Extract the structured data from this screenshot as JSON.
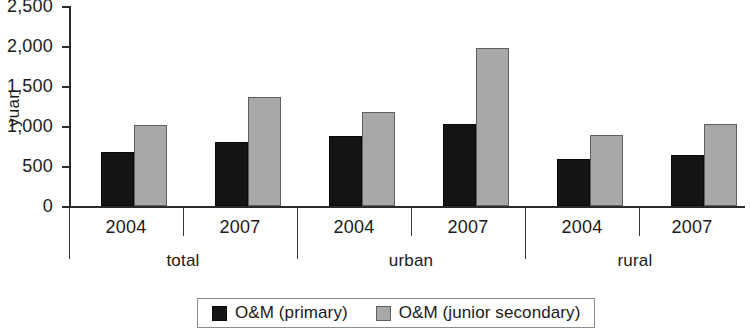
{
  "chart_data": {
    "type": "bar",
    "title": "",
    "subtitle": "",
    "xlabel": "",
    "ylabel": "yuan",
    "ylim": [
      0,
      2500
    ],
    "yticks": [
      "0",
      "500",
      "1,000",
      "1,500",
      "2,000",
      "2,500"
    ],
    "ytick_values": [
      0,
      500,
      1000,
      1500,
      2000,
      2500
    ],
    "grid": false,
    "legend_position": "bottom",
    "categories": [
      "2004",
      "2007",
      "2004",
      "2007",
      "2004",
      "2007"
    ],
    "groups": [
      {
        "label": "total",
        "years": [
          "2004",
          "2007"
        ]
      },
      {
        "label": "urban",
        "years": [
          "2004",
          "2007"
        ]
      },
      {
        "label": "rural",
        "years": [
          "2004",
          "2007"
        ]
      }
    ],
    "series": [
      {
        "name": "O&M (primary)",
        "color": "#141414",
        "values": [
          670,
          800,
          880,
          1030,
          590,
          640
        ]
      },
      {
        "name": "O&M (junior secondary)",
        "color": "#a8a8a8",
        "values": [
          1010,
          1360,
          1170,
          1970,
          890,
          1020
        ]
      }
    ]
  },
  "legend": {
    "items": [
      {
        "label": "O&M (primary)",
        "swatch": "primary"
      },
      {
        "label": "O&M (junior secondary)",
        "swatch": "secondary"
      }
    ]
  }
}
